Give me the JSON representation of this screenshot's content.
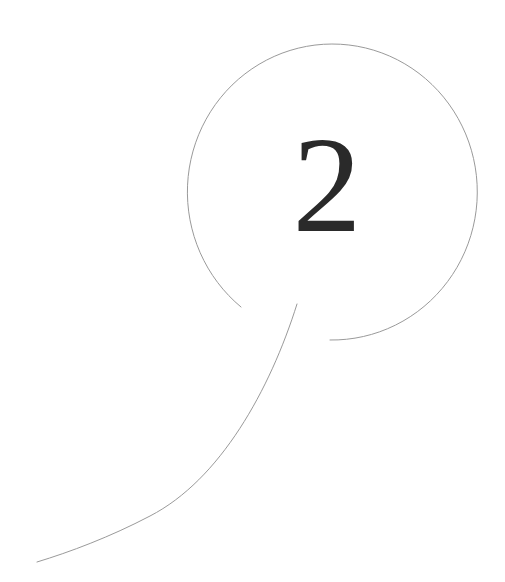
{
  "figure": {
    "number": "2",
    "colors": {
      "background": "#ffffff",
      "stroke": "#9a9a9a",
      "number": "#2a2a2a"
    },
    "bubble": {
      "center_x": 331,
      "center_y": 192,
      "radius_x": 145,
      "radius_y": 148,
      "arc_start": [
        330,
        340
      ],
      "arc_end": [
        241,
        307
      ]
    },
    "tail": {
      "start": [
        297,
        304
      ],
      "end": [
        37,
        562
      ]
    }
  }
}
